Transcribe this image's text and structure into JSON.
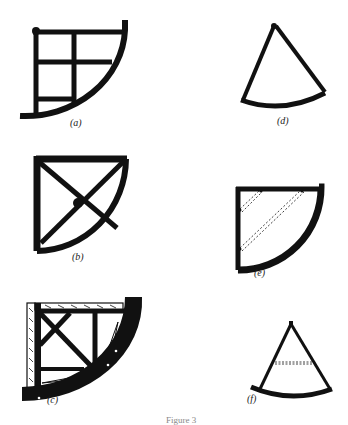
{
  "figure": {
    "caption": "Figure 3",
    "panels": [
      {
        "id": "a",
        "label": "(a)",
        "description": "Quarter-circle quadrant frame with grid of two vertical and three horizontal bars"
      },
      {
        "id": "b",
        "label": "(b)",
        "description": "Quarter-circle quadrant frame with X-shaped diagonal braces"
      },
      {
        "id": "c",
        "label": "(c)",
        "description": "Heavy quadrant with wood-grain frame, diagonal cross brace, and thick arc"
      },
      {
        "id": "d",
        "label": "(d)",
        "description": "Sector (pie-slice) frame with apex at top and curved base"
      },
      {
        "id": "e",
        "label": "(e)",
        "description": "Quarter-circle quadrant frame with dashed diagonal sight lines"
      },
      {
        "id": "f",
        "label": "(f)",
        "description": "Sector frame with apex at top, dashed horizontal crossbar, and curved base"
      }
    ]
  },
  "colors": {
    "ink": "#111111",
    "paper": "#ffffff"
  }
}
